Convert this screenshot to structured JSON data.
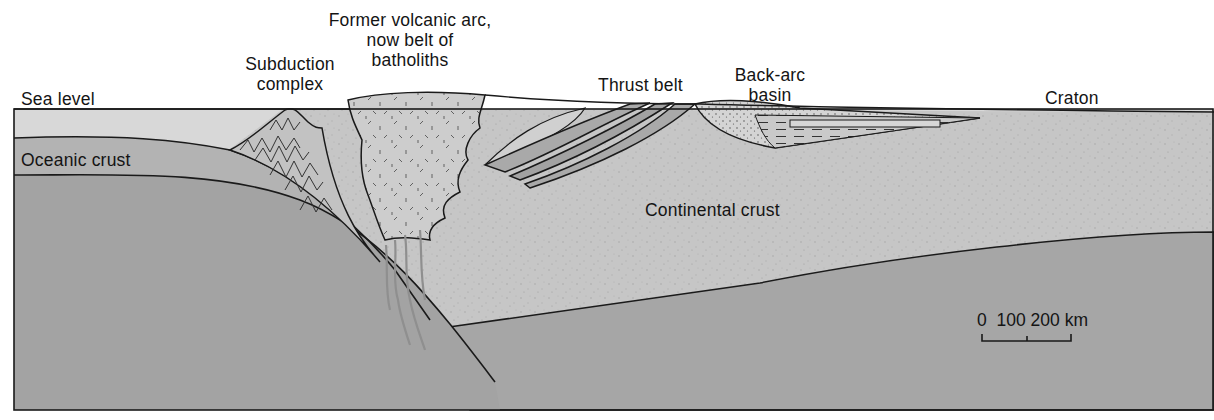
{
  "figure": {
    "type": "geologic cross-section"
  },
  "labels": {
    "sea_level": "Sea level",
    "subduction_complex": [
      "Subduction",
      "complex"
    ],
    "volcanic_arc": [
      "Former volcanic arc,",
      "now belt of",
      "batholiths"
    ],
    "thrust_belt": "Thrust belt",
    "back_arc_basin": [
      "Back-arc",
      "basin"
    ],
    "craton": "Craton",
    "oceanic_crust": "Oceanic crust",
    "continental_crust": "Continental crust"
  },
  "scale_bar": {
    "ticks": [
      "0",
      "100",
      "200"
    ],
    "unit": "km",
    "text": "0  100 200 km"
  },
  "colors": {
    "sea": "#d6d6d6",
    "oceanic_crust": "#b3b3b3",
    "mantle": "#a4a4a4",
    "continental_crust": "#c7c7c7",
    "batholith": "#cfcfcf",
    "thrust_sheet": "#a9a9a9",
    "basin_fill": "#d2d2d2",
    "outline": "#1a1a1a"
  }
}
